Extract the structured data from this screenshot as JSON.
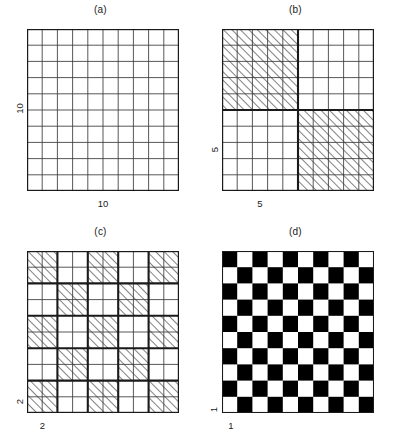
{
  "figure": {
    "title": "",
    "background": "#ffffff",
    "line_color": "#1a1a1a",
    "thin_line_color": "#3a3a3a",
    "hatch_color": "#1a1a1a",
    "fill_black": "#000000",
    "fill_white": "#ffffff"
  },
  "panels": [
    {
      "id": "a",
      "caption": "(a)",
      "grid_cells": 10,
      "block_size": 1,
      "style": "plain",
      "y_label": "10",
      "x_label": "10",
      "x_label_span_cells": 10,
      "y_label_span_cells": 10
    },
    {
      "id": "b",
      "caption": "(b)",
      "grid_cells": 10,
      "block_size": 5,
      "style": "hatched",
      "y_label": "5",
      "x_label": "5",
      "x_label_span_cells": 5,
      "y_label_span_cells": 5
    },
    {
      "id": "c",
      "caption": "(c)",
      "grid_cells": 10,
      "block_size": 2,
      "style": "hatched",
      "y_label": "2",
      "x_label": "2",
      "x_label_span_cells": 2,
      "y_label_span_cells": 2
    },
    {
      "id": "d",
      "caption": "(d)",
      "grid_cells": 10,
      "block_size": 1,
      "style": "solid",
      "y_label": "1",
      "x_label": "1",
      "x_label_span_cells": 1,
      "y_label_span_cells": 1
    }
  ]
}
